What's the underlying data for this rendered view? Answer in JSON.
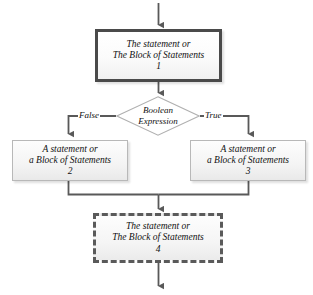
{
  "diagram": {
    "colors": {
      "primary_border": "#4a4a4a",
      "branch_border": "#b8b8b8",
      "dashed_border": "#5a5a5a",
      "connector": "#595959",
      "text": "#111111",
      "background": "#ffffff"
    },
    "nodes": {
      "statement_block_1": {
        "line1": "The statement or",
        "line2": "The Block of Statements",
        "number": "1"
      },
      "decision": {
        "line1": "Boolean",
        "line2": "Expression"
      },
      "statement_block_2": {
        "line1": "A statement or",
        "line2": "a Block of Statements",
        "number": "2"
      },
      "statement_block_3": {
        "line1": "A statement or",
        "line2": "a Block of Statements",
        "number": "3"
      },
      "statement_block_4": {
        "line1": "The statement or",
        "line2": "The Block of Statements",
        "number": "4"
      }
    },
    "edges": {
      "false_label": "False",
      "true_label": "True"
    }
  }
}
